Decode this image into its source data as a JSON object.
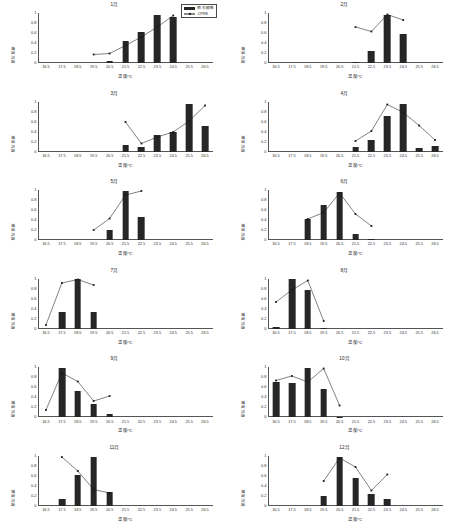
{
  "figure": {
    "axis_x_label": "温度/℃",
    "axis_y_label": "相对频数",
    "x_ticks": [
      "16.5",
      "17.5",
      "18.5",
      "19.5",
      "20.5",
      "21.5",
      "22.5",
      "23.5",
      "24.5",
      "25.5",
      "26.5"
    ],
    "y_ticks": [
      "0",
      "0.2",
      "0.4",
      "0.6",
      "0.8",
      "1"
    ],
    "y_range": [
      0,
      1
    ],
    "bar_color": "#262626",
    "line_color": "#1a1a1a",
    "axis_color": "#555555"
  },
  "legend": {
    "position": "top-right-of-first-panel",
    "items": [
      {
        "label": "相对频数",
        "type": "bar",
        "swatch": "bar-swatch-icon"
      },
      {
        "label": "CPRE",
        "type": "line",
        "swatch": "line-marker-icon"
      }
    ]
  },
  "chart_data": [
    {
      "type": "bar",
      "title": "1月",
      "xlabel": "温度/℃",
      "ylabel": "相对频数",
      "ylim": [
        0,
        1
      ],
      "grid": false,
      "categories": [
        "16.5",
        "17.5",
        "18.5",
        "19.5",
        "20.5",
        "21.5",
        "22.5",
        "23.5",
        "24.5",
        "25.5",
        "26.5"
      ],
      "series": [
        {
          "name": "相对频数",
          "type": "bar",
          "values": [
            0,
            0,
            0,
            0,
            0.05,
            0.44,
            0.62,
            0.97,
            0.92,
            0,
            0
          ]
        },
        {
          "name": "CPRE",
          "type": "line",
          "values": [
            null,
            null,
            null,
            0.17,
            0.19,
            0.35,
            0.52,
            0.72,
            0.95,
            null,
            null
          ]
        }
      ]
    },
    {
      "type": "bar",
      "title": "2月",
      "xlabel": "温度/℃",
      "ylabel": "相对频数",
      "ylim": [
        0,
        1
      ],
      "grid": false,
      "categories": [
        "16.5",
        "17.5",
        "18.5",
        "19.5",
        "20.5",
        "21.5",
        "22.5",
        "23.5",
        "24.5",
        "25.5",
        "26.5"
      ],
      "series": [
        {
          "name": "相对频数",
          "type": "bar",
          "values": [
            0,
            0,
            0,
            0,
            0,
            0.03,
            0.25,
            0.97,
            0.59,
            0,
            0
          ]
        },
        {
          "name": "CPRE",
          "type": "line",
          "values": [
            null,
            null,
            null,
            null,
            null,
            0.72,
            0.63,
            0.97,
            0.86,
            null,
            null
          ]
        }
      ]
    },
    {
      "type": "bar",
      "title": "3月",
      "xlabel": "温度/℃",
      "ylabel": "相对频数",
      "ylim": [
        0,
        1
      ],
      "grid": false,
      "categories": [
        "16.5",
        "17.5",
        "18.5",
        "19.5",
        "20.5",
        "21.5",
        "22.5",
        "23.5",
        "24.5",
        "25.5",
        "26.5"
      ],
      "series": [
        {
          "name": "相对频数",
          "type": "bar",
          "values": [
            0,
            0,
            0,
            0,
            0,
            0.13,
            0.09,
            0.33,
            0.39,
            0.96,
            0.52
          ]
        },
        {
          "name": "CPRE",
          "type": "line",
          "values": [
            null,
            null,
            null,
            null,
            null,
            0.6,
            0.17,
            0.3,
            0.4,
            0.62,
            0.93
          ]
        }
      ]
    },
    {
      "type": "bar",
      "title": "4月",
      "xlabel": "温度/℃",
      "ylabel": "相对频数",
      "ylim": [
        0,
        1
      ],
      "grid": false,
      "categories": [
        "16.5",
        "17.5",
        "18.5",
        "19.5",
        "20.5",
        "21.5",
        "22.5",
        "23.5",
        "24.5",
        "25.5",
        "26.5"
      ],
      "series": [
        {
          "name": "相对频数",
          "type": "bar",
          "values": [
            0,
            0,
            0,
            0,
            0,
            0.1,
            0.23,
            0.71,
            0.95,
            0.08,
            0.11
          ]
        },
        {
          "name": "CPRE",
          "type": "line",
          "values": [
            null,
            null,
            null,
            null,
            null,
            0.22,
            0.42,
            0.95,
            0.79,
            0.53,
            0.24
          ]
        }
      ]
    },
    {
      "type": "bar",
      "title": "5月",
      "xlabel": "温度/℃",
      "ylabel": "相对频数",
      "ylim": [
        0,
        1
      ],
      "grid": false,
      "categories": [
        "16.5",
        "17.5",
        "18.5",
        "19.5",
        "20.5",
        "21.5",
        "22.5",
        "23.5",
        "24.5",
        "25.5",
        "26.5"
      ],
      "series": [
        {
          "name": "相对频数",
          "type": "bar",
          "values": [
            0,
            0,
            0,
            0,
            0.2,
            0.98,
            0.47,
            0,
            0,
            0,
            0
          ]
        },
        {
          "name": "CPRE",
          "type": "line",
          "values": [
            null,
            null,
            null,
            0.2,
            0.43,
            0.9,
            0.98,
            null,
            null,
            null,
            null
          ]
        }
      ]
    },
    {
      "type": "bar",
      "title": "6月",
      "xlabel": "温度/℃",
      "ylabel": "相对频数",
      "ylim": [
        0,
        1
      ],
      "grid": false,
      "categories": [
        "16.5",
        "17.5",
        "18.5",
        "19.5",
        "20.5",
        "21.5",
        "22.5",
        "23.5",
        "24.5",
        "25.5",
        "26.5"
      ],
      "series": [
        {
          "name": "相对频数",
          "type": "bar",
          "values": [
            0,
            0,
            0.42,
            0.7,
            0.96,
            0.13,
            0.03,
            0,
            0,
            0,
            0
          ]
        },
        {
          "name": "CPRE",
          "type": "line",
          "values": [
            null,
            null,
            0.42,
            0.55,
            0.94,
            0.52,
            0.28,
            null,
            null,
            null,
            null
          ]
        }
      ]
    },
    {
      "type": "bar",
      "title": "7月",
      "xlabel": "温度/℃",
      "ylabel": "相对频数",
      "ylim": [
        0,
        1
      ],
      "grid": false,
      "categories": [
        "16.5",
        "17.5",
        "18.5",
        "19.5",
        "20.5",
        "21.5",
        "22.5",
        "23.5",
        "24.5",
        "25.5",
        "26.5"
      ],
      "series": [
        {
          "name": "相对频数",
          "type": "bar",
          "values": [
            0,
            0.34,
            0.99,
            0.34,
            0,
            0,
            0,
            0,
            0,
            0,
            0
          ]
        },
        {
          "name": "CPRE",
          "type": "line",
          "values": [
            0.08,
            0.92,
            0.99,
            0.88,
            null,
            null,
            null,
            null,
            null,
            null,
            null
          ]
        }
      ]
    },
    {
      "type": "bar",
      "title": "8月",
      "xlabel": "温度/℃",
      "ylabel": "相对频数",
      "ylim": [
        0,
        1
      ],
      "grid": false,
      "categories": [
        "16.5",
        "17.5",
        "18.5",
        "19.5",
        "20.5",
        "21.5",
        "22.5",
        "23.5",
        "24.5",
        "25.5",
        "26.5"
      ],
      "series": [
        {
          "name": "相对频数",
          "type": "bar",
          "values": [
            0.03,
            0.99,
            0.77,
            0.01,
            0,
            0,
            0,
            0,
            0,
            0,
            0
          ]
        },
        {
          "name": "CPRE",
          "type": "line",
          "values": [
            0.54,
            0.78,
            0.97,
            0.16,
            null,
            null,
            null,
            null,
            null,
            null,
            null
          ]
        }
      ]
    },
    {
      "type": "bar",
      "title": "9月",
      "xlabel": "温度/℃",
      "ylabel": "相对频数",
      "ylim": [
        0,
        1
      ],
      "grid": false,
      "categories": [
        "16.5",
        "17.5",
        "18.5",
        "19.5",
        "20.5",
        "21.5",
        "22.5",
        "23.5",
        "24.5",
        "25.5",
        "26.5"
      ],
      "series": [
        {
          "name": "相对频数",
          "type": "bar",
          "values": [
            0,
            0.98,
            0.52,
            0.26,
            0.06,
            0,
            0,
            0,
            0,
            0,
            0
          ]
        },
        {
          "name": "CPRE",
          "type": "line",
          "values": [
            0.14,
            0.88,
            0.71,
            0.32,
            0.42,
            null,
            null,
            null,
            null,
            null,
            null
          ]
        }
      ]
    },
    {
      "type": "bar",
      "title": "10月",
      "xlabel": "温度/℃",
      "ylabel": "相对频数",
      "ylim": [
        0,
        1
      ],
      "grid": false,
      "categories": [
        "16.5",
        "17.5",
        "18.5",
        "19.5",
        "20.5",
        "21.5",
        "22.5",
        "23.5",
        "24.5",
        "25.5",
        "26.5"
      ],
      "series": [
        {
          "name": "相对频数",
          "type": "bar",
          "values": [
            0.71,
            0.69,
            0.99,
            0.57,
            0.01,
            0,
            0,
            0,
            0,
            0,
            0
          ]
        },
        {
          "name": "CPRE",
          "type": "line",
          "values": [
            0.73,
            0.82,
            0.7,
            0.97,
            0.23,
            null,
            null,
            null,
            null,
            null,
            null
          ]
        }
      ]
    },
    {
      "type": "bar",
      "title": "11月",
      "xlabel": "温度/℃",
      "ylabel": "相对频数",
      "ylim": [
        0,
        1
      ],
      "grid": false,
      "categories": [
        "16.5",
        "17.5",
        "18.5",
        "19.5",
        "20.5",
        "21.5",
        "22.5",
        "23.5",
        "24.5",
        "25.5",
        "26.5"
      ],
      "series": [
        {
          "name": "相对频数",
          "type": "bar",
          "values": [
            0,
            0.14,
            0.62,
            0.98,
            0.28,
            0,
            0,
            0,
            0,
            0,
            0
          ]
        },
        {
          "name": "CPRE",
          "type": "line",
          "values": [
            null,
            0.98,
            0.7,
            0.33,
            0.26,
            null,
            null,
            null,
            null,
            null,
            null
          ]
        }
      ]
    },
    {
      "type": "bar",
      "title": "12月",
      "xlabel": "温度/℃",
      "ylabel": "相对频数",
      "ylim": [
        0,
        1
      ],
      "grid": false,
      "categories": [
        "16.5",
        "17.5",
        "18.5",
        "19.5",
        "20.5",
        "21.5",
        "22.5",
        "23.5",
        "24.5",
        "25.5",
        "26.5"
      ],
      "series": [
        {
          "name": "相对频数",
          "type": "bar",
          "values": [
            0,
            0,
            0,
            0.19,
            0.97,
            0.56,
            0.24,
            0.13,
            0,
            0,
            0
          ]
        },
        {
          "name": "CPRE",
          "type": "line",
          "values": [
            null,
            null,
            null,
            0.5,
            0.96,
            0.78,
            0.31,
            0.63,
            null,
            null,
            null
          ]
        }
      ]
    }
  ]
}
